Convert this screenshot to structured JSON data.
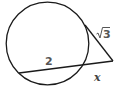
{
  "diagram": {
    "type": "circle-tangent-secant",
    "labels": {
      "secant_internal": "2",
      "secant_external": "x",
      "tangent_radicand": "3",
      "tangent_radical_sign": "√"
    },
    "colors": {
      "stroke": "#1a1a1a",
      "label": "#555555",
      "background": "#ffffff"
    }
  }
}
